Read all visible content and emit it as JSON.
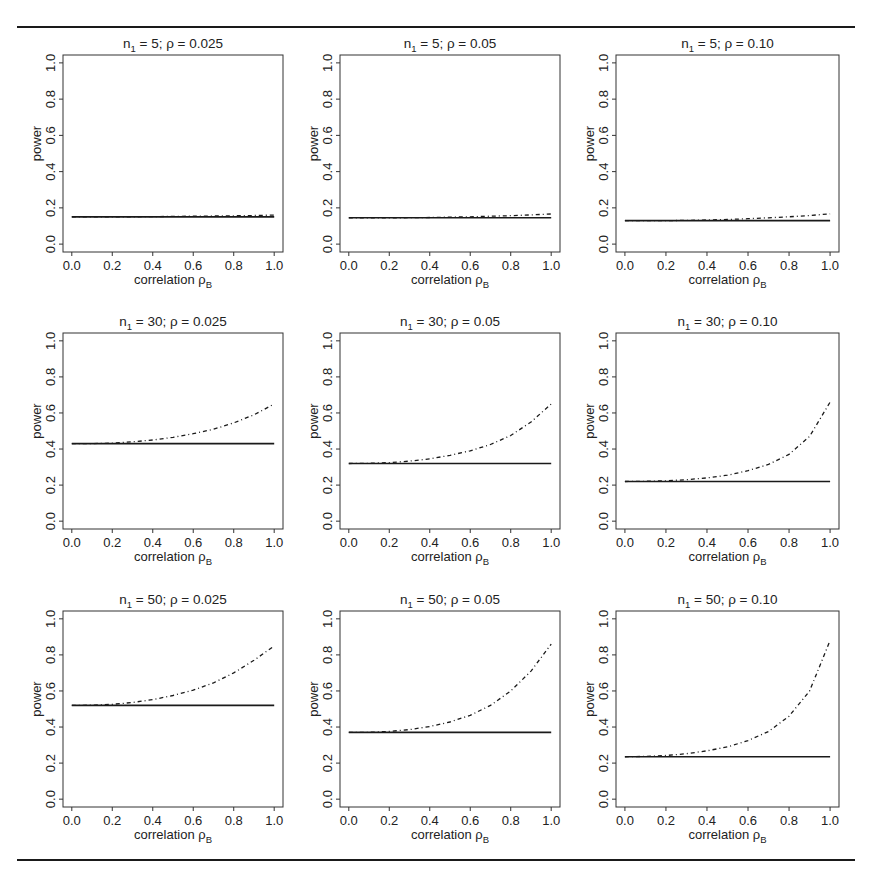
{
  "figure": {
    "rule_color": "#1a1a1a",
    "line_color": "#1a1a1a",
    "frame_color": "#333333",
    "top_rule_y": 27,
    "bottom_rule_y": 860,
    "rule_x": [
      17,
      855
    ]
  },
  "chart_data": [
    {
      "type": "line",
      "title": "n₁ = 5; ρ = 0.025",
      "title_n": "5",
      "title_rho": "0.025",
      "xlabel": "correlation ρB",
      "ylabel": "power",
      "xlim": [
        0,
        1
      ],
      "ylim": [
        0,
        1
      ],
      "xticks": [
        "0.0",
        "0.2",
        "0.4",
        "0.6",
        "0.8",
        "1.0"
      ],
      "yticks": [
        "0.0",
        "0.2",
        "0.4",
        "0.6",
        "0.8",
        "1.0"
      ],
      "grid": false,
      "x": [
        0,
        0.1,
        0.2,
        0.3,
        0.4,
        0.5,
        0.6,
        0.7,
        0.8,
        0.9,
        1.0
      ],
      "series": [
        {
          "name": "solid",
          "style": "solid",
          "values": [
            0.15,
            0.15,
            0.15,
            0.15,
            0.15,
            0.15,
            0.15,
            0.15,
            0.15,
            0.15,
            0.15
          ]
        },
        {
          "name": "dashed",
          "style": "dashed",
          "values": [
            0.15,
            0.15,
            0.15,
            0.151,
            0.152,
            0.153,
            0.154,
            0.155,
            0.156,
            0.158,
            0.16
          ]
        }
      ]
    },
    {
      "type": "line",
      "title": "n₁ = 5; ρ = 0.05",
      "title_n": "5",
      "title_rho": "0.05",
      "xlabel": "correlation ρB",
      "ylabel": "power",
      "xlim": [
        0,
        1
      ],
      "ylim": [
        0,
        1
      ],
      "xticks": [
        "0.0",
        "0.2",
        "0.4",
        "0.6",
        "0.8",
        "1.0"
      ],
      "yticks": [
        "0.0",
        "0.2",
        "0.4",
        "0.6",
        "0.8",
        "1.0"
      ],
      "grid": false,
      "x": [
        0,
        0.1,
        0.2,
        0.3,
        0.4,
        0.5,
        0.6,
        0.7,
        0.8,
        0.9,
        1.0
      ],
      "series": [
        {
          "name": "solid",
          "style": "solid",
          "values": [
            0.145,
            0.145,
            0.145,
            0.145,
            0.145,
            0.145,
            0.145,
            0.145,
            0.145,
            0.145,
            0.145
          ]
        },
        {
          "name": "dashed",
          "style": "dashed",
          "values": [
            0.145,
            0.145,
            0.145,
            0.146,
            0.147,
            0.149,
            0.151,
            0.154,
            0.157,
            0.161,
            0.166
          ]
        }
      ]
    },
    {
      "type": "line",
      "title": "n₁ = 5; ρ = 0.10",
      "title_n": "5",
      "title_rho": "0.10",
      "xlabel": "correlation ρB",
      "ylabel": "power",
      "xlim": [
        0,
        1
      ],
      "ylim": [
        0,
        1
      ],
      "xticks": [
        "0.0",
        "0.2",
        "0.4",
        "0.6",
        "0.8",
        "1.0"
      ],
      "yticks": [
        "0.0",
        "0.2",
        "0.4",
        "0.6",
        "0.8",
        "1.0"
      ],
      "grid": false,
      "x": [
        0,
        0.1,
        0.2,
        0.3,
        0.4,
        0.5,
        0.6,
        0.7,
        0.8,
        0.9,
        1.0
      ],
      "series": [
        {
          "name": "solid",
          "style": "solid",
          "values": [
            0.13,
            0.13,
            0.13,
            0.13,
            0.13,
            0.13,
            0.13,
            0.13,
            0.13,
            0.13,
            0.13
          ]
        },
        {
          "name": "dashed",
          "style": "dashed",
          "values": [
            0.13,
            0.13,
            0.13,
            0.131,
            0.133,
            0.136,
            0.14,
            0.145,
            0.151,
            0.158,
            0.167
          ]
        }
      ]
    },
    {
      "type": "line",
      "title": "n₁ = 30; ρ = 0.025",
      "title_n": "30",
      "title_rho": "0.025",
      "xlabel": "correlation ρB",
      "ylabel": "power",
      "xlim": [
        0,
        1
      ],
      "ylim": [
        0,
        1
      ],
      "xticks": [
        "0.0",
        "0.2",
        "0.4",
        "0.6",
        "0.8",
        "1.0"
      ],
      "yticks": [
        "0.0",
        "0.2",
        "0.4",
        "0.6",
        "0.8",
        "1.0"
      ],
      "grid": false,
      "x": [
        0,
        0.1,
        0.2,
        0.3,
        0.4,
        0.5,
        0.6,
        0.7,
        0.8,
        0.9,
        1.0
      ],
      "series": [
        {
          "name": "solid",
          "style": "solid",
          "values": [
            0.43,
            0.43,
            0.43,
            0.43,
            0.43,
            0.43,
            0.43,
            0.43,
            0.43,
            0.43,
            0.43
          ]
        },
        {
          "name": "dashed",
          "style": "dashed",
          "values": [
            0.43,
            0.43,
            0.433,
            0.44,
            0.45,
            0.465,
            0.485,
            0.51,
            0.545,
            0.59,
            0.65
          ]
        }
      ]
    },
    {
      "type": "line",
      "title": "n₁ = 30; ρ = 0.05",
      "title_n": "30",
      "title_rho": "0.05",
      "xlabel": "correlation ρB",
      "ylabel": "power",
      "xlim": [
        0,
        1
      ],
      "ylim": [
        0,
        1
      ],
      "xticks": [
        "0.0",
        "0.2",
        "0.4",
        "0.6",
        "0.8",
        "1.0"
      ],
      "yticks": [
        "0.0",
        "0.2",
        "0.4",
        "0.6",
        "0.8",
        "1.0"
      ],
      "grid": false,
      "x": [
        0,
        0.1,
        0.2,
        0.3,
        0.4,
        0.5,
        0.6,
        0.7,
        0.8,
        0.9,
        1.0
      ],
      "series": [
        {
          "name": "solid",
          "style": "solid",
          "values": [
            0.32,
            0.32,
            0.32,
            0.32,
            0.32,
            0.32,
            0.32,
            0.32,
            0.32,
            0.32,
            0.32
          ]
        },
        {
          "name": "dashed",
          "style": "dashed",
          "values": [
            0.32,
            0.321,
            0.325,
            0.333,
            0.345,
            0.365,
            0.39,
            0.425,
            0.475,
            0.55,
            0.65
          ]
        }
      ]
    },
    {
      "type": "line",
      "title": "n₁ = 30; ρ = 0.10",
      "title_n": "30",
      "title_rho": "0.10",
      "xlabel": "correlation ρB",
      "ylabel": "power",
      "xlim": [
        0,
        1
      ],
      "ylim": [
        0,
        1
      ],
      "xticks": [
        "0.0",
        "0.2",
        "0.4",
        "0.6",
        "0.8",
        "1.0"
      ],
      "yticks": [
        "0.0",
        "0.2",
        "0.4",
        "0.6",
        "0.8",
        "1.0"
      ],
      "grid": false,
      "x": [
        0,
        0.1,
        0.2,
        0.3,
        0.4,
        0.5,
        0.6,
        0.7,
        0.8,
        0.9,
        1.0
      ],
      "series": [
        {
          "name": "solid",
          "style": "solid",
          "values": [
            0.22,
            0.22,
            0.22,
            0.22,
            0.22,
            0.22,
            0.22,
            0.22,
            0.22,
            0.22,
            0.22
          ]
        },
        {
          "name": "dashed",
          "style": "dashed",
          "values": [
            0.22,
            0.221,
            0.224,
            0.23,
            0.24,
            0.255,
            0.28,
            0.315,
            0.37,
            0.47,
            0.66
          ]
        }
      ]
    },
    {
      "type": "line",
      "title": "n₁ = 50; ρ = 0.025",
      "title_n": "50",
      "title_rho": "0.025",
      "xlabel": "correlation ρB",
      "ylabel": "power",
      "xlim": [
        0,
        1
      ],
      "ylim": [
        0,
        1
      ],
      "xticks": [
        "0.0",
        "0.2",
        "0.4",
        "0.6",
        "0.8",
        "1.0"
      ],
      "yticks": [
        "0.0",
        "0.2",
        "0.4",
        "0.6",
        "0.8",
        "1.0"
      ],
      "grid": false,
      "x": [
        0,
        0.1,
        0.2,
        0.3,
        0.4,
        0.5,
        0.6,
        0.7,
        0.8,
        0.9,
        1.0
      ],
      "series": [
        {
          "name": "solid",
          "style": "solid",
          "values": [
            0.52,
            0.52,
            0.52,
            0.52,
            0.52,
            0.52,
            0.52,
            0.52,
            0.52,
            0.52,
            0.52
          ]
        },
        {
          "name": "dashed",
          "style": "dashed",
          "values": [
            0.52,
            0.521,
            0.526,
            0.536,
            0.552,
            0.575,
            0.605,
            0.645,
            0.7,
            0.77,
            0.85
          ]
        }
      ]
    },
    {
      "type": "line",
      "title": "n₁ = 50; ρ = 0.05",
      "title_n": "50",
      "title_rho": "0.05",
      "xlabel": "correlation ρB",
      "ylabel": "power",
      "xlim": [
        0,
        1
      ],
      "ylim": [
        0,
        1
      ],
      "xticks": [
        "0.0",
        "0.2",
        "0.4",
        "0.6",
        "0.8",
        "1.0"
      ],
      "yticks": [
        "0.0",
        "0.2",
        "0.4",
        "0.6",
        "0.8",
        "1.0"
      ],
      "grid": false,
      "x": [
        0,
        0.1,
        0.2,
        0.3,
        0.4,
        0.5,
        0.6,
        0.7,
        0.8,
        0.9,
        1.0
      ],
      "series": [
        {
          "name": "solid",
          "style": "solid",
          "values": [
            0.37,
            0.37,
            0.37,
            0.37,
            0.37,
            0.37,
            0.37,
            0.37,
            0.37,
            0.37,
            0.37
          ]
        },
        {
          "name": "dashed",
          "style": "dashed",
          "values": [
            0.37,
            0.371,
            0.376,
            0.386,
            0.403,
            0.428,
            0.465,
            0.52,
            0.6,
            0.71,
            0.86
          ]
        }
      ]
    },
    {
      "type": "line",
      "title": "n₁ = 50; ρ = 0.10",
      "title_n": "50",
      "title_rho": "0.10",
      "xlabel": "correlation ρB",
      "ylabel": "power",
      "xlim": [
        0,
        1
      ],
      "ylim": [
        0,
        1
      ],
      "xticks": [
        "0.0",
        "0.2",
        "0.4",
        "0.6",
        "0.8",
        "1.0"
      ],
      "yticks": [
        "0.0",
        "0.2",
        "0.4",
        "0.6",
        "0.8",
        "1.0"
      ],
      "grid": false,
      "x": [
        0,
        0.1,
        0.2,
        0.3,
        0.4,
        0.5,
        0.6,
        0.7,
        0.8,
        0.9,
        1.0
      ],
      "series": [
        {
          "name": "solid",
          "style": "solid",
          "values": [
            0.235,
            0.235,
            0.235,
            0.235,
            0.235,
            0.235,
            0.235,
            0.235,
            0.235,
            0.235,
            0.235
          ]
        },
        {
          "name": "dashed",
          "style": "dashed",
          "values": [
            0.235,
            0.237,
            0.242,
            0.252,
            0.268,
            0.29,
            0.325,
            0.375,
            0.46,
            0.6,
            0.88
          ]
        }
      ]
    }
  ],
  "panel_layout": {
    "columns": [
      [
        63,
        283
      ],
      [
        340,
        560
      ],
      [
        616,
        839
      ]
    ],
    "rows": [
      [
        55,
        252
      ],
      [
        333,
        529
      ],
      [
        611,
        807
      ]
    ]
  }
}
